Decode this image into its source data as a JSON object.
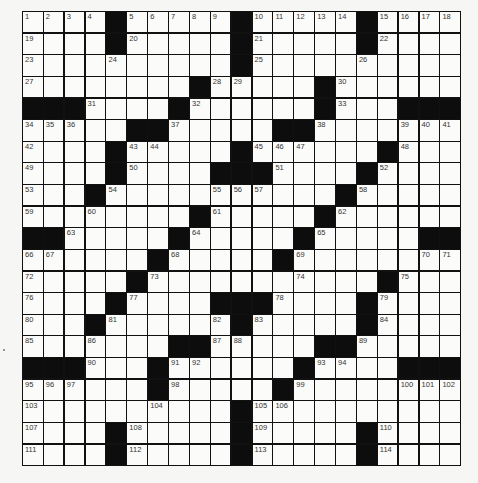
{
  "puzzle": {
    "type": "crossword",
    "rows": 21,
    "cols": 21,
    "grid": [
      [
        "1",
        "2",
        "3",
        "4",
        "#",
        "5",
        "6",
        "7",
        "8",
        "9",
        "#",
        "10",
        "11",
        "12",
        "13",
        "14",
        "#",
        "15",
        "16",
        "17",
        "18"
      ],
      [
        "19",
        "",
        "",
        "",
        "#",
        "20",
        "",
        "",
        "",
        "",
        "#",
        "21",
        "",
        "",
        "",
        "",
        "#",
        "22",
        "",
        "",
        ""
      ],
      [
        "23",
        "",
        "",
        "",
        "24",
        "",
        "",
        "",
        "",
        "",
        "#",
        "25",
        "",
        "",
        "",
        "",
        "26",
        "",
        "",
        "",
        ""
      ],
      [
        "27",
        "",
        "",
        "",
        "",
        "",
        "",
        "",
        "#",
        "28",
        "29",
        "",
        "",
        "",
        "#",
        "30",
        "",
        "",
        "",
        "",
        ""
      ],
      [
        "#",
        "#",
        "#",
        "31",
        "",
        "",
        "",
        "#",
        "32",
        "",
        "",
        "",
        "",
        "",
        "#",
        "33",
        "",
        "",
        "#",
        "#",
        "#"
      ],
      [
        "34",
        "35",
        "36",
        "",
        "",
        "#",
        "#",
        "37",
        "",
        "",
        "",
        "",
        "#",
        "#",
        "38",
        "",
        "",
        "",
        "39",
        "40",
        "41"
      ],
      [
        "42",
        "",
        "",
        "",
        "#",
        "43",
        "44",
        "",
        "",
        "",
        "#",
        "45",
        "46",
        "47",
        "",
        "",
        "",
        "#",
        "48",
        "",
        ""
      ],
      [
        "49",
        "",
        "",
        "",
        "#",
        "50",
        "",
        "",
        "",
        "#",
        "#",
        "#",
        "51",
        "",
        "",
        "",
        "#",
        "52",
        "",
        "",
        ""
      ],
      [
        "53",
        "",
        "",
        "#",
        "54",
        "",
        "",
        "",
        "",
        "55",
        "56",
        "57",
        "",
        "",
        "",
        "#",
        "58",
        "",
        "",
        "",
        ""
      ],
      [
        "59",
        "",
        "",
        "60",
        "",
        "",
        "",
        "",
        "#",
        "61",
        "",
        "",
        "",
        "",
        "#",
        "62",
        "",
        "",
        "",
        "",
        ""
      ],
      [
        "#",
        "#",
        "63",
        "",
        "",
        "",
        "",
        "#",
        "64",
        "",
        "",
        "",
        "",
        "#",
        "65",
        "",
        "",
        "",
        "",
        "#",
        "#"
      ],
      [
        "66",
        "67",
        "",
        "",
        "",
        "",
        "#",
        "68",
        "",
        "",
        "",
        "",
        "#",
        "69",
        "",
        "",
        "",
        "",
        "",
        "70",
        "71"
      ],
      [
        "72",
        "",
        "",
        "",
        "",
        "#",
        "73",
        "",
        "",
        "",
        "",
        "",
        "",
        "74",
        "",
        "",
        "",
        "#",
        "75",
        "",
        ""
      ],
      [
        "76",
        "",
        "",
        "",
        "#",
        "77",
        "",
        "",
        "",
        "#",
        "#",
        "#",
        "78",
        "",
        "",
        "",
        "#",
        "79",
        "",
        "",
        ""
      ],
      [
        "80",
        "",
        "",
        "#",
        "81",
        "",
        "",
        "",
        "",
        "82",
        "#",
        "83",
        "",
        "",
        "",
        "",
        "#",
        "84",
        "",
        "",
        ""
      ],
      [
        "85",
        "",
        "",
        "86",
        "",
        "",
        "",
        "#",
        "#",
        "87",
        "88",
        "",
        "",
        "",
        "#",
        "#",
        "89",
        "",
        "",
        "",
        ""
      ],
      [
        "#",
        "#",
        "#",
        "90",
        "",
        "",
        "#",
        "91",
        "92",
        "",
        "",
        "",
        "",
        "#",
        "93",
        "94",
        "",
        "",
        "#",
        "#",
        "#"
      ],
      [
        "95",
        "96",
        "97",
        "",
        "",
        "",
        "#",
        "98",
        "",
        "",
        "",
        "",
        "#",
        "99",
        "",
        "",
        "",
        "",
        "100",
        "101",
        "102"
      ],
      [
        "103",
        "",
        "",
        "",
        "",
        "",
        "104",
        "",
        "",
        "",
        "#",
        "105",
        "106",
        "",
        "",
        "",
        "",
        "",
        "",
        "",
        ""
      ],
      [
        "107",
        "",
        "",
        "",
        "#",
        "108",
        "",
        "",
        "",
        "",
        "#",
        "109",
        "",
        "",
        "",
        "",
        "#",
        "110",
        "",
        "",
        ""
      ],
      [
        "111",
        "",
        "",
        "",
        "#",
        "112",
        "",
        "",
        "",
        "",
        "#",
        "113",
        "",
        "",
        "",
        "",
        "#",
        "114",
        "",
        "",
        ""
      ]
    ]
  },
  "colors": {
    "black_cell": "#0d0d0d",
    "white_cell": "#fbfbf9",
    "grid_line": "#111111",
    "page_bg": "#f6f6f4"
  }
}
